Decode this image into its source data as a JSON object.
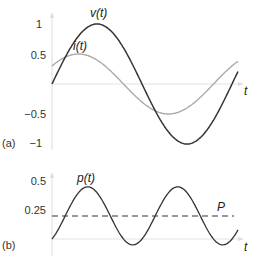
{
  "chart_data": [
    {
      "panel": "(a)",
      "type": "line",
      "title": "",
      "xlabel": "t",
      "ylabel": "",
      "yticks": [
        "1",
        "0.5",
        "-0.5",
        "-1"
      ],
      "ylim": [
        -1,
        1
      ],
      "grid": false,
      "series": [
        {
          "name": "v(t)",
          "label": "v(t)",
          "amplitude": 1.0,
          "phase_deg": 0,
          "color": "#333333"
        },
        {
          "name": "i(t)",
          "label": "i(t)",
          "amplitude": 0.5,
          "phase_deg": 37,
          "color": "#aaaaaa"
        }
      ],
      "x_range_periods": [
        0,
        1.03
      ]
    },
    {
      "panel": "(b)",
      "type": "line",
      "title": "",
      "xlabel": "t",
      "ylabel": "",
      "yticks": [
        "0.5",
        "0.25"
      ],
      "ylim": [
        0,
        0.5
      ],
      "grid": false,
      "series": [
        {
          "name": "p(t)",
          "label": "p(t)",
          "description": "instantaneous power v(t)·i(t)",
          "max": 0.45,
          "min": -0.05,
          "color": "#333333"
        },
        {
          "name": "P",
          "label": "P",
          "description": "average power (dashed)",
          "value": 0.2,
          "color": "#333333",
          "style": "dashed"
        }
      ]
    }
  ],
  "labels": {
    "a": {
      "panel": "(a)",
      "y1": "1",
      "y05": "0.5",
      "ym05": "−0.5",
      "ym1": "−1",
      "v": "v(t)",
      "i": "i(t)",
      "t": "t"
    },
    "b": {
      "panel": "(b)",
      "y05": "0.5",
      "y025": "0.25",
      "p": "p(t)",
      "P": "P",
      "t": "t"
    }
  }
}
